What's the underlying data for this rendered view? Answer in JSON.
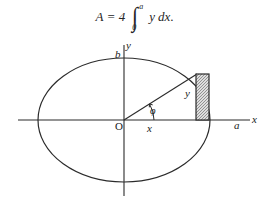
{
  "formula": {
    "area_symbol": "A",
    "equals": "=",
    "coefficient": "4",
    "integral_lower": "0",
    "integral_upper": "a",
    "integrand": "y",
    "differential": "dx",
    "terminator": "."
  },
  "figure": {
    "type": "ellipse-with-inscribed-strip",
    "labels": {
      "y_axis": "y",
      "x_axis": "x",
      "semi_minor_axis": "b",
      "semi_major_axis": "a",
      "origin": "O",
      "angle": "φ",
      "abscissa": "x",
      "ordinate": "y"
    },
    "geometry": {
      "center": [
        124,
        84
      ],
      "semi_axis_x": 86,
      "semi_axis_y": 62,
      "x_axis_extent": [
        18,
        250
      ],
      "y_axis_extent": [
        9,
        160
      ],
      "strip_left": 196,
      "strip_right": 209,
      "strip_top": 38,
      "strip_bottom": 84,
      "radius_endpoint": [
        197,
        38
      ],
      "angle_arc_radius": 30
    },
    "colors": {
      "stroke": "#2b2b2b",
      "hatch": "#8c8c8c",
      "background": "#ffffff"
    }
  }
}
